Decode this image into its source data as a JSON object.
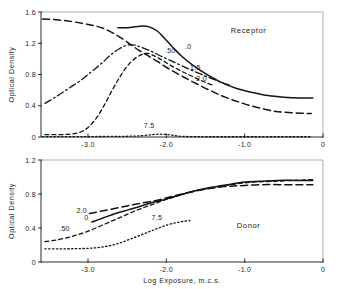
{
  "figure": {
    "caption": "",
    "background": "#ffffff",
    "ink_color": "#141414"
  },
  "chart_data": [
    {
      "type": "line",
      "id": "receptor",
      "title": "Receptor",
      "xlabel": "",
      "ylabel": "Optical Density",
      "xlim": [
        -3.6,
        0.0
      ],
      "ylim": [
        0.0,
        1.6
      ],
      "xticks": [
        -3.0,
        -2.0,
        -1.0,
        0
      ],
      "xticklabels": [
        "-3.0",
        "-2.0",
        "-1.0",
        "0"
      ],
      "yticks": [
        0,
        0.4,
        0.8,
        1.2,
        1.6
      ],
      "yticklabels": [
        "0",
        "0.4",
        "0.8",
        "1.2",
        "1.6"
      ],
      "grid": false,
      "legend": "inline-curve-labels",
      "series": [
        {
          "name": "0",
          "label": ".0",
          "style": "solid",
          "label_x": -1.72,
          "label_y": 1.13,
          "points": [
            [
              -2.62,
              1.4
            ],
            [
              -2.5,
              1.4
            ],
            [
              -2.4,
              1.41
            ],
            [
              -2.3,
              1.42
            ],
            [
              -2.22,
              1.41
            ],
            [
              -2.12,
              1.36
            ],
            [
              -2.02,
              1.26
            ],
            [
              -1.92,
              1.15
            ],
            [
              -1.8,
              1.03
            ],
            [
              -1.65,
              0.91
            ],
            [
              -1.5,
              0.81
            ],
            [
              -1.3,
              0.7
            ],
            [
              -1.1,
              0.62
            ],
            [
              -0.9,
              0.57
            ],
            [
              -0.7,
              0.53
            ],
            [
              -0.5,
              0.51
            ],
            [
              -0.3,
              0.5
            ],
            [
              -0.13,
              0.5
            ]
          ]
        },
        {
          "name": ".50",
          "label": ".50",
          "style": "dashdot",
          "label_x": -1.95,
          "label_y": 1.07,
          "points": [
            [
              -3.55,
              0.43
            ],
            [
              -3.4,
              0.52
            ],
            [
              -3.25,
              0.62
            ],
            [
              -3.1,
              0.72
            ],
            [
              -2.95,
              0.84
            ],
            [
              -2.82,
              0.95
            ],
            [
              -2.7,
              1.06
            ],
            [
              -2.6,
              1.13
            ],
            [
              -2.52,
              1.17
            ],
            [
              -2.45,
              1.18
            ],
            [
              -2.38,
              1.17
            ],
            [
              -2.3,
              1.14
            ],
            [
              -2.2,
              1.1
            ],
            [
              -2.08,
              1.04
            ],
            [
              -1.95,
              0.98
            ],
            [
              -1.8,
              0.91
            ],
            [
              -1.62,
              0.83
            ],
            [
              -1.45,
              0.76
            ],
            [
              -1.3,
              0.7
            ],
            [
              -1.18,
              0.66
            ]
          ]
        },
        {
          "name": "1.5",
          "label": "1.5",
          "style": "dashed-short",
          "label_x": -1.63,
          "label_y": 0.86,
          "points": [
            [
              -3.55,
              0.03
            ],
            [
              -3.35,
              0.03
            ],
            [
              -3.2,
              0.04
            ],
            [
              -3.08,
              0.07
            ],
            [
              -2.98,
              0.14
            ],
            [
              -2.88,
              0.26
            ],
            [
              -2.78,
              0.43
            ],
            [
              -2.68,
              0.62
            ],
            [
              -2.58,
              0.79
            ],
            [
              -2.48,
              0.93
            ],
            [
              -2.38,
              1.02
            ],
            [
              -2.3,
              1.06
            ],
            [
              -2.24,
              1.07
            ],
            [
              -2.18,
              1.05
            ],
            [
              -2.1,
              1.01
            ],
            [
              -2.0,
              0.95
            ],
            [
              -1.88,
              0.88
            ],
            [
              -1.72,
              0.8
            ],
            [
              -1.55,
              0.72
            ],
            [
              -1.4,
              0.66
            ]
          ]
        },
        {
          "name": "2.0",
          "label": "2.0",
          "style": "dashed-long",
          "label_x": -1.55,
          "label_y": 0.72,
          "points": [
            [
              -3.58,
              1.51
            ],
            [
              -3.4,
              1.5
            ],
            [
              -3.22,
              1.48
            ],
            [
              -3.05,
              1.45
            ],
            [
              -2.9,
              1.42
            ],
            [
              -2.78,
              1.38
            ],
            [
              -2.66,
              1.32
            ],
            [
              -2.55,
              1.25
            ],
            [
              -2.45,
              1.18
            ],
            [
              -2.35,
              1.11
            ],
            [
              -2.25,
              1.05
            ],
            [
              -2.12,
              0.97
            ],
            [
              -1.98,
              0.88
            ],
            [
              -1.82,
              0.79
            ],
            [
              -1.65,
              0.7
            ],
            [
              -1.45,
              0.6
            ],
            [
              -1.25,
              0.51
            ],
            [
              -1.05,
              0.44
            ],
            [
              -0.85,
              0.38
            ],
            [
              -0.62,
              0.33
            ],
            [
              -0.4,
              0.31
            ],
            [
              -0.15,
              0.3
            ]
          ]
        },
        {
          "name": "7.5",
          "label": "7.5",
          "style": "dotted",
          "label_x": -2.22,
          "label_y": 0.12,
          "points": [
            [
              -3.58,
              0.005
            ],
            [
              -3.2,
              0.005
            ],
            [
              -2.9,
              0.006
            ],
            [
              -2.6,
              0.008
            ],
            [
              -2.4,
              0.012
            ],
            [
              -2.28,
              0.02
            ],
            [
              -2.18,
              0.03
            ],
            [
              -2.1,
              0.036
            ],
            [
              -2.02,
              0.034
            ],
            [
              -1.95,
              0.026
            ],
            [
              -1.88,
              0.016
            ],
            [
              -1.8,
              0.008
            ],
            [
              -1.6,
              0.004
            ],
            [
              -1.3,
              0.003
            ],
            [
              -0.9,
              0.003
            ],
            [
              -0.15,
              0.003
            ]
          ]
        }
      ]
    },
    {
      "type": "line",
      "id": "donor",
      "title": "Donor",
      "xlabel": "Log Exposure, m.c.s.",
      "ylabel": "Optical Density",
      "xlim": [
        -3.6,
        0.0
      ],
      "ylim": [
        0.0,
        1.2
      ],
      "xticks": [
        -3.0,
        -2.0,
        -1.0,
        0
      ],
      "xticklabels": [
        "-3.0",
        "-2.0",
        "-1.0",
        "0"
      ],
      "yticks": [
        0,
        0.4,
        0.8,
        1.2
      ],
      "yticklabels": [
        "0",
        "0.4",
        "0.8",
        "1.2"
      ],
      "grid": false,
      "legend": "inline-curve-labels",
      "series": [
        {
          "name": "0",
          "label": "0",
          "style": "solid",
          "label_x": -3.02,
          "label_y": 0.5,
          "points": [
            [
              -2.95,
              0.47
            ],
            [
              -2.8,
              0.52
            ],
            [
              -2.65,
              0.57
            ],
            [
              -2.5,
              0.61
            ],
            [
              -2.35,
              0.65
            ],
            [
              -2.18,
              0.7
            ],
            [
              -2.0,
              0.74
            ],
            [
              -1.82,
              0.79
            ],
            [
              -1.62,
              0.84
            ],
            [
              -1.42,
              0.88
            ],
            [
              -1.22,
              0.91
            ],
            [
              -1.0,
              0.94
            ],
            [
              -0.8,
              0.95
            ],
            [
              -0.58,
              0.96
            ],
            [
              -0.35,
              0.96
            ],
            [
              -0.13,
              0.96
            ]
          ]
        },
        {
          "name": "2.0",
          "label": "2.0",
          "style": "dashed-long",
          "label_x": -3.08,
          "label_y": 0.58,
          "points": [
            [
              -2.98,
              0.57
            ],
            [
              -2.82,
              0.6
            ],
            [
              -2.66,
              0.63
            ],
            [
              -2.5,
              0.66
            ],
            [
              -2.33,
              0.69
            ],
            [
              -2.15,
              0.72
            ],
            [
              -1.98,
              0.76
            ],
            [
              -1.8,
              0.8
            ],
            [
              -1.6,
              0.84
            ],
            [
              -1.4,
              0.87
            ],
            [
              -1.2,
              0.89
            ],
            [
              -1.0,
              0.9
            ],
            [
              -0.78,
              0.91
            ],
            [
              -0.55,
              0.91
            ],
            [
              -0.32,
              0.91
            ],
            [
              -0.13,
              0.91
            ]
          ]
        },
        {
          "name": ".50",
          "label": ".50",
          "style": "dashed-short",
          "label_x": -3.3,
          "label_y": 0.37,
          "points": [
            [
              -3.55,
              0.24
            ],
            [
              -3.4,
              0.26
            ],
            [
              -3.25,
              0.29
            ],
            [
              -3.1,
              0.33
            ],
            [
              -2.95,
              0.38
            ],
            [
              -2.8,
              0.44
            ],
            [
              -2.65,
              0.5
            ],
            [
              -2.5,
              0.56
            ],
            [
              -2.35,
              0.62
            ],
            [
              -2.2,
              0.67
            ],
            [
              -2.05,
              0.72
            ],
            [
              -1.88,
              0.77
            ],
            [
              -1.7,
              0.82
            ],
            [
              -1.5,
              0.86
            ],
            [
              -1.3,
              0.89
            ],
            [
              -1.1,
              0.92
            ],
            [
              -0.88,
              0.94
            ],
            [
              -0.62,
              0.95
            ],
            [
              -0.38,
              0.96
            ],
            [
              -0.13,
              0.97
            ]
          ]
        },
        {
          "name": "7.5",
          "label": "7.5",
          "style": "dotted",
          "label_x": -2.12,
          "label_y": 0.5,
          "points": [
            [
              -3.55,
              0.155
            ],
            [
              -3.35,
              0.155
            ],
            [
              -3.15,
              0.157
            ],
            [
              -2.98,
              0.162
            ],
            [
              -2.85,
              0.172
            ],
            [
              -2.72,
              0.192
            ],
            [
              -2.6,
              0.222
            ],
            [
              -2.48,
              0.262
            ],
            [
              -2.36,
              0.305
            ],
            [
              -2.24,
              0.348
            ],
            [
              -2.12,
              0.392
            ],
            [
              -2.0,
              0.432
            ],
            [
              -1.88,
              0.462
            ],
            [
              -1.78,
              0.478
            ],
            [
              -1.7,
              0.486
            ]
          ]
        }
      ]
    }
  ]
}
